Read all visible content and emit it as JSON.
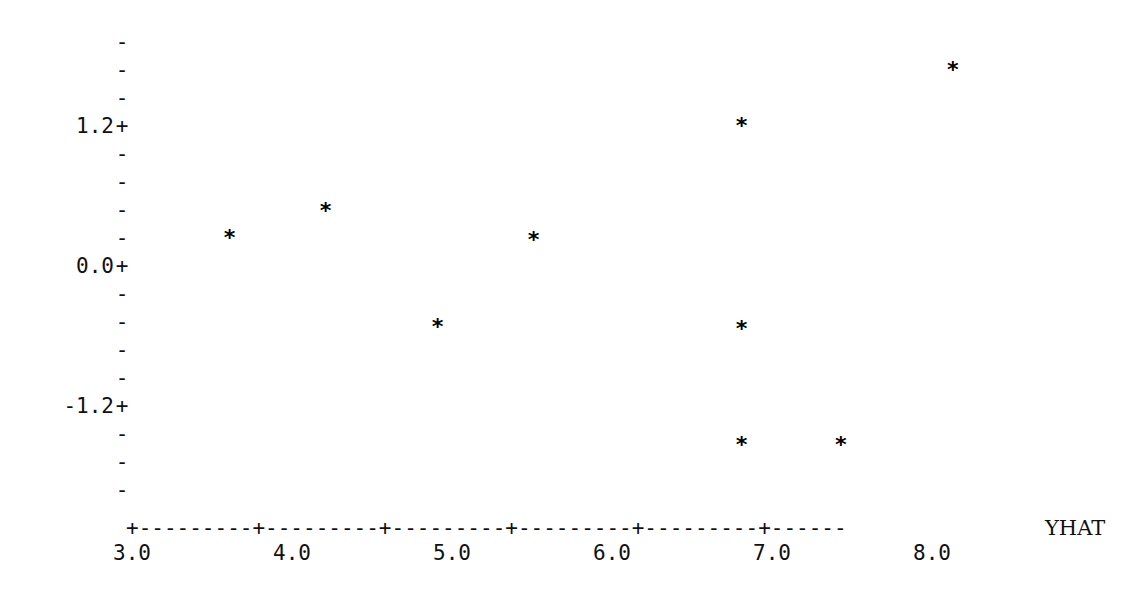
{
  "chart_data": {
    "type": "scatter",
    "title": "",
    "subtitle": "",
    "xlabel": "YHAT",
    "ylabel": "",
    "xlim": [
      2.75,
      8.6
    ],
    "ylim": [
      -2.0,
      2.1
    ],
    "grid": false,
    "legend": null,
    "marker_glyph": "*",
    "axis_tick_glyph": "+",
    "axis_line_glyph": "-",
    "y_tick_minor_glyph": "-",
    "x_ticks": [
      {
        "label": "3.0",
        "value": 3.0
      },
      {
        "label": "4.0",
        "value": 4.0
      },
      {
        "label": "5.0",
        "value": 5.0
      },
      {
        "label": "6.0",
        "value": 6.0
      },
      {
        "label": "7.0",
        "value": 7.0
      },
      {
        "label": "8.0",
        "value": 8.0
      }
    ],
    "y_ticks": [
      {
        "label": "1.2",
        "value": 1.2
      },
      {
        "label": "0.0",
        "value": 0.0
      },
      {
        "label": "-1.2",
        "value": -1.2
      }
    ],
    "y_minor_rows": [
      {
        "label": "",
        "value": 1.92
      },
      {
        "label": "",
        "value": 1.68
      },
      {
        "label": "",
        "value": 1.44
      },
      {
        "label": "1.2",
        "value": 1.2
      },
      {
        "label": "",
        "value": 0.96
      },
      {
        "label": "",
        "value": 0.72
      },
      {
        "label": "",
        "value": 0.48
      },
      {
        "label": "",
        "value": 0.24
      },
      {
        "label": "0.0",
        "value": 0.0
      },
      {
        "label": "",
        "value": -0.24
      },
      {
        "label": "",
        "value": -0.48
      },
      {
        "label": "",
        "value": -0.72
      },
      {
        "label": "",
        "value": -0.96
      },
      {
        "label": "-1.2",
        "value": -1.2
      },
      {
        "label": "",
        "value": -1.44
      },
      {
        "label": "",
        "value": -1.68
      },
      {
        "label": "",
        "value": -1.92
      }
    ],
    "points": [
      {
        "x": 3.61,
        "y": 0.24
      },
      {
        "x": 4.21,
        "y": 0.47
      },
      {
        "x": 4.91,
        "y": -0.52
      },
      {
        "x": 5.51,
        "y": 0.22
      },
      {
        "x": 6.81,
        "y": 1.2
      },
      {
        "x": 6.81,
        "y": -0.54
      },
      {
        "x": 6.81,
        "y": -1.53
      },
      {
        "x": 7.43,
        "y": -1.53
      },
      {
        "x": 8.13,
        "y": 1.68
      }
    ],
    "axis_line_text": "+---------+---------+---------+---------+---------+------",
    "colors": {
      "background": "#ffffff",
      "foreground": "#101010",
      "marker": "#000000"
    }
  }
}
